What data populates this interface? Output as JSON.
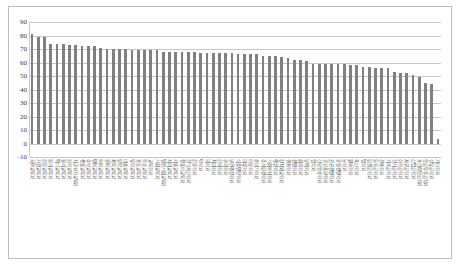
{
  "chart_data": {
    "type": "bar",
    "title": "",
    "subtitle": "",
    "xlabel": "",
    "ylabel": "",
    "ylim": [
      -10,
      90
    ],
    "ytick_step": 10,
    "yticks": [
      -10,
      0,
      10,
      20,
      30,
      40,
      50,
      60,
      70,
      80,
      90
    ],
    "grid": true,
    "legend": false,
    "bar_color": "#808080",
    "gridline_color": "#c6c6c6",
    "orientation": "vertical",
    "sorted": "descending",
    "categories": [
      "국어교육과",
      "가정교육과",
      "한문교육과",
      "윤리교육과",
      "역사교육과",
      "물리교육과",
      "화학교육과",
      "지구과학교육과",
      "생물교육과",
      "수학교육과",
      "영어교육과",
      "독어교육과",
      "불어교육과",
      "체육교육과",
      "음악교육과",
      "미술교육과",
      "유아교육과",
      "초등교육과",
      "특수교육과",
      "교육학과",
      "사회교육과",
      "일반사회교육과",
      "지리교육과",
      "기술교육과",
      "컴퓨터교육과",
      "전자계산학과",
      "간호학과",
      "약학과",
      "의학과",
      "치의학과",
      "한의학과",
      "수의학과",
      "보건행정학과",
      "식품영양학과",
      "의류학과",
      "아동학과",
      "소비자학과",
      "주거환경학과",
      "사회복지학과",
      "행정학과",
      "정치외교학과",
      "경제학과",
      "경영학과",
      "회계학과",
      "무역학과",
      "법학과",
      "신문방송학과",
      "광고홍보학과",
      "관광경영학과",
      "호텔경영학과",
      "농학과",
      "원예학과",
      "축산학과",
      "임학과",
      "환경공학과",
      "토목공학과",
      "건축학과",
      "기계공학과",
      "전기공학과",
      "화학공학과",
      "재료공학과",
      "산업공학과",
      "조선해양공학과",
      "항공우주공학과",
      "섬유공학과",
      "기타학과"
    ],
    "values": [
      81,
      79,
      79,
      74,
      74,
      74,
      73,
      73,
      72,
      72,
      72,
      71,
      70,
      70,
      70,
      70,
      69,
      69,
      69,
      69,
      69,
      68,
      68,
      68,
      68,
      68,
      68,
      67,
      67,
      67,
      67,
      67,
      67,
      66,
      66,
      66,
      66,
      65,
      65,
      65,
      64,
      63,
      62,
      62,
      61,
      59,
      59,
      59,
      59,
      59,
      59,
      58,
      58,
      57,
      57,
      56,
      56,
      56,
      53,
      52,
      52,
      51,
      49,
      45,
      44,
      3
    ]
  },
  "axis": {
    "y_unit": "",
    "x_axis_note": ""
  }
}
